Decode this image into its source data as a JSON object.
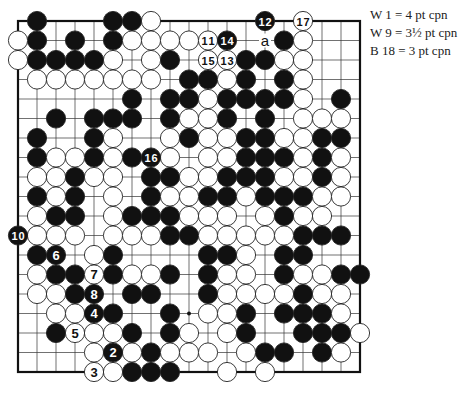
{
  "diagram": {
    "type": "go-board",
    "size": 19,
    "origin": {
      "x": 18,
      "y": 21
    },
    "spacing": {
      "x": 19.0,
      "y": 19.5
    },
    "stone_radius": 9.6,
    "colors": {
      "black": "#111111",
      "white": "#ffffff",
      "line": "#333333",
      "border": "#111111"
    },
    "star_points": [
      [
        9,
        15
      ]
    ],
    "stones": {
      "black": [
        [
          1,
          0
        ],
        [
          5,
          0
        ],
        [
          6,
          0
        ],
        [
          1,
          1
        ],
        [
          3,
          1
        ],
        [
          5,
          1
        ],
        [
          14,
          1
        ],
        [
          1,
          2
        ],
        [
          2,
          2
        ],
        [
          3,
          2
        ],
        [
          4,
          2
        ],
        [
          8,
          2
        ],
        [
          12,
          2
        ],
        [
          13,
          2
        ],
        [
          9,
          3
        ],
        [
          10,
          3
        ],
        [
          12,
          3
        ],
        [
          14,
          3
        ],
        [
          6,
          4
        ],
        [
          8,
          4
        ],
        [
          9,
          4
        ],
        [
          11,
          4
        ],
        [
          12,
          4
        ],
        [
          13,
          4
        ],
        [
          14,
          4
        ],
        [
          17,
          4
        ],
        [
          2,
          5
        ],
        [
          4,
          5
        ],
        [
          5,
          5
        ],
        [
          6,
          5
        ],
        [
          8,
          5
        ],
        [
          11,
          5
        ],
        [
          13,
          5
        ],
        [
          1,
          6
        ],
        [
          4,
          6
        ],
        [
          9,
          6
        ],
        [
          12,
          6
        ],
        [
          13,
          6
        ],
        [
          16,
          6
        ],
        [
          17,
          6
        ],
        [
          1,
          7
        ],
        [
          4,
          7
        ],
        [
          6,
          7
        ],
        [
          12,
          7
        ],
        [
          13,
          7
        ],
        [
          14,
          7
        ],
        [
          16,
          7
        ],
        [
          3,
          8
        ],
        [
          7,
          8
        ],
        [
          8,
          8
        ],
        [
          11,
          8
        ],
        [
          12,
          8
        ],
        [
          13,
          8
        ],
        [
          16,
          8
        ],
        [
          1,
          9
        ],
        [
          3,
          9
        ],
        [
          7,
          9
        ],
        [
          10,
          9
        ],
        [
          11,
          9
        ],
        [
          13,
          9
        ],
        [
          14,
          9
        ],
        [
          15,
          9
        ],
        [
          2,
          10
        ],
        [
          3,
          10
        ],
        [
          6,
          10
        ],
        [
          7,
          10
        ],
        [
          8,
          10
        ],
        [
          14,
          10
        ],
        [
          8,
          11
        ],
        [
          9,
          11
        ],
        [
          15,
          11
        ],
        [
          16,
          11
        ],
        [
          17,
          11
        ],
        [
          1,
          12
        ],
        [
          5,
          12
        ],
        [
          10,
          12
        ],
        [
          11,
          12
        ],
        [
          14,
          12
        ],
        [
          15,
          12
        ],
        [
          2,
          13
        ],
        [
          3,
          13
        ],
        [
          5,
          13
        ],
        [
          8,
          13
        ],
        [
          10,
          13
        ],
        [
          14,
          13
        ],
        [
          17,
          13
        ],
        [
          18,
          13
        ],
        [
          3,
          14
        ],
        [
          6,
          14
        ],
        [
          7,
          14
        ],
        [
          10,
          14
        ],
        [
          15,
          14
        ],
        [
          5,
          15
        ],
        [
          8,
          15
        ],
        [
          12,
          15
        ],
        [
          14,
          15
        ],
        [
          15,
          15
        ],
        [
          16,
          15
        ],
        [
          2,
          16
        ],
        [
          6,
          16
        ],
        [
          8,
          16
        ],
        [
          12,
          16
        ],
        [
          15,
          16
        ],
        [
          16,
          16
        ],
        [
          17,
          16
        ],
        [
          7,
          17
        ],
        [
          13,
          17
        ],
        [
          14,
          17
        ],
        [
          16,
          17
        ],
        [
          6,
          18
        ],
        [
          7,
          18
        ],
        [
          8,
          18
        ]
      ],
      "white": [
        [
          7,
          0
        ],
        [
          0,
          1
        ],
        [
          6,
          1
        ],
        [
          7,
          1
        ],
        [
          8,
          1
        ],
        [
          9,
          1
        ],
        [
          15,
          1
        ],
        [
          0,
          2
        ],
        [
          5,
          2
        ],
        [
          7,
          2
        ],
        [
          14,
          2
        ],
        [
          15,
          2
        ],
        [
          1,
          3
        ],
        [
          2,
          3
        ],
        [
          3,
          3
        ],
        [
          4,
          3
        ],
        [
          5,
          3
        ],
        [
          6,
          3
        ],
        [
          7,
          3
        ],
        [
          11,
          3
        ],
        [
          15,
          3
        ],
        [
          10,
          4
        ],
        [
          15,
          4
        ],
        [
          9,
          5
        ],
        [
          10,
          5
        ],
        [
          15,
          5
        ],
        [
          16,
          5
        ],
        [
          17,
          5
        ],
        [
          5,
          6
        ],
        [
          8,
          6
        ],
        [
          10,
          6
        ],
        [
          11,
          6
        ],
        [
          14,
          6
        ],
        [
          15,
          6
        ],
        [
          2,
          7
        ],
        [
          3,
          7
        ],
        [
          5,
          7
        ],
        [
          8,
          7
        ],
        [
          10,
          7
        ],
        [
          11,
          7
        ],
        [
          15,
          7
        ],
        [
          17,
          7
        ],
        [
          1,
          8
        ],
        [
          2,
          8
        ],
        [
          4,
          8
        ],
        [
          5,
          8
        ],
        [
          9,
          8
        ],
        [
          10,
          8
        ],
        [
          14,
          8
        ],
        [
          15,
          8
        ],
        [
          17,
          8
        ],
        [
          2,
          9
        ],
        [
          5,
          9
        ],
        [
          8,
          9
        ],
        [
          9,
          9
        ],
        [
          12,
          9
        ],
        [
          16,
          9
        ],
        [
          17,
          9
        ],
        [
          1,
          10
        ],
        [
          5,
          10
        ],
        [
          9,
          10
        ],
        [
          10,
          10
        ],
        [
          11,
          10
        ],
        [
          13,
          10
        ],
        [
          15,
          10
        ],
        [
          16,
          10
        ],
        [
          1,
          11
        ],
        [
          2,
          11
        ],
        [
          3,
          11
        ],
        [
          5,
          11
        ],
        [
          6,
          11
        ],
        [
          7,
          11
        ],
        [
          10,
          11
        ],
        [
          11,
          11
        ],
        [
          12,
          11
        ],
        [
          13,
          11
        ],
        [
          14,
          11
        ],
        [
          4,
          12
        ],
        [
          12,
          12
        ],
        [
          1,
          13
        ],
        [
          6,
          13
        ],
        [
          7,
          13
        ],
        [
          11,
          13
        ],
        [
          12,
          13
        ],
        [
          15,
          13
        ],
        [
          16,
          13
        ],
        [
          1,
          14
        ],
        [
          2,
          14
        ],
        [
          11,
          14
        ],
        [
          12,
          14
        ],
        [
          13,
          14
        ],
        [
          14,
          14
        ],
        [
          16,
          14
        ],
        [
          17,
          14
        ],
        [
          2,
          15
        ],
        [
          3,
          15
        ],
        [
          10,
          15
        ],
        [
          11,
          15
        ],
        [
          17,
          15
        ],
        [
          4,
          16
        ],
        [
          5,
          16
        ],
        [
          9,
          16
        ],
        [
          11,
          16
        ],
        [
          18,
          16
        ],
        [
          4,
          17
        ],
        [
          6,
          17
        ],
        [
          8,
          17
        ],
        [
          9,
          17
        ],
        [
          10,
          17
        ],
        [
          12,
          17
        ],
        [
          17,
          17
        ],
        [
          5,
          18
        ],
        [
          11,
          18
        ],
        [
          13,
          18
        ]
      ]
    },
    "numbered_stones": [
      {
        "n": "2",
        "color": "black",
        "at": [
          5,
          17
        ]
      },
      {
        "n": "3",
        "color": "white",
        "at": [
          4,
          18
        ]
      },
      {
        "n": "4",
        "color": "black",
        "at": [
          4,
          15
        ]
      },
      {
        "n": "5",
        "color": "white",
        "at": [
          3,
          16
        ]
      },
      {
        "n": "6",
        "color": "black",
        "at": [
          2,
          12
        ]
      },
      {
        "n": "7",
        "color": "white",
        "at": [
          4,
          13
        ]
      },
      {
        "n": "8",
        "color": "black",
        "at": [
          4,
          14
        ]
      },
      {
        "n": "10",
        "color": "black",
        "at": [
          0,
          11
        ]
      },
      {
        "n": "11",
        "color": "white",
        "at": [
          10,
          1
        ]
      },
      {
        "n": "12",
        "color": "black",
        "at": [
          13,
          0
        ]
      },
      {
        "n": "13",
        "color": "white",
        "at": [
          11,
          2
        ]
      },
      {
        "n": "14",
        "color": "black",
        "at": [
          11,
          1
        ]
      },
      {
        "n": "15",
        "color": "white",
        "at": [
          10,
          2
        ]
      },
      {
        "n": "16",
        "color": "black",
        "at": [
          7,
          7
        ]
      },
      {
        "n": "17",
        "color": "white",
        "at": [
          15,
          0
        ]
      }
    ],
    "labels": [
      {
        "text": "a",
        "at": [
          13,
          1
        ]
      }
    ]
  },
  "legend": {
    "lines": [
      "W 1 = 4 pt cpn",
      "W 9 = 3½ pt cpn",
      "B 18 = 3 pt cpn"
    ]
  }
}
